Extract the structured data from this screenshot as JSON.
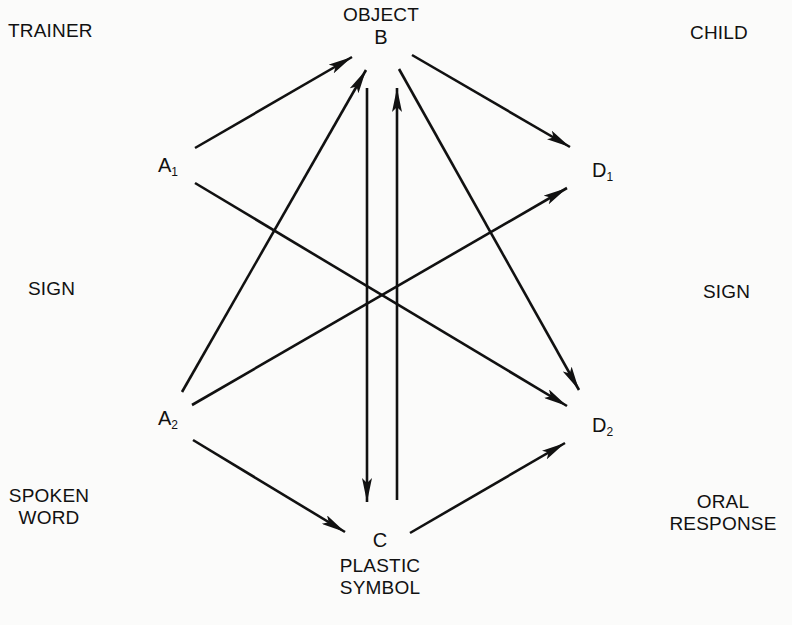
{
  "labels": {
    "trainer": "TRAINER",
    "child": "CHILD",
    "sign_left": "SIGN",
    "sign_right": "SIGN",
    "spoken_word_1": "SPOKEN",
    "spoken_word_2": "WORD",
    "oral_response_1": "ORAL",
    "oral_response_2": "RESPONSE",
    "object": "OBJECT",
    "plastic_symbol_1": "PLASTIC",
    "plastic_symbol_2": "SYMBOL"
  },
  "nodes": {
    "a1": {
      "letter": "A",
      "sub": "1"
    },
    "a2": {
      "letter": "A",
      "sub": "2"
    },
    "b": {
      "letter": "B"
    },
    "c": {
      "letter": "C"
    },
    "d1": {
      "letter": "D",
      "sub": "1"
    },
    "d2": {
      "letter": "D",
      "sub": "2"
    }
  },
  "edges": [
    {
      "from": "A1",
      "to": "B"
    },
    {
      "from": "A2",
      "to": "B"
    },
    {
      "from": "B",
      "to": "D1"
    },
    {
      "from": "B",
      "to": "D2"
    },
    {
      "from": "A1",
      "to": "D2"
    },
    {
      "from": "A2",
      "to": "D1"
    },
    {
      "from": "B",
      "to": "C"
    },
    {
      "from": "C",
      "to": "B"
    },
    {
      "from": "A2",
      "to": "C"
    },
    {
      "from": "C",
      "to": "D2"
    }
  ],
  "colors": {
    "ink": "#111111",
    "paper": "#fbfbfa"
  }
}
